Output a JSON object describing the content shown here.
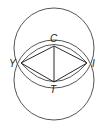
{
  "diagram": {
    "type": "geometric-construction",
    "stroke_color": "#555555",
    "line_color": "#2a2a2a",
    "background": "#ffffff",
    "points": [
      {
        "id": "C",
        "label": "C",
        "x": 54,
        "y": 46
      },
      {
        "id": "Y",
        "label": "Y",
        "x": 21,
        "y": 63
      },
      {
        "id": "I",
        "label": "I",
        "x": 87,
        "y": 63
      },
      {
        "id": "T",
        "label": "T",
        "x": 54,
        "y": 82
      }
    ],
    "circles": [
      {
        "name": "top-circle",
        "cx": 54,
        "cy": 48,
        "r": 40
      },
      {
        "name": "bottom-circle",
        "cx": 54,
        "cy": 80,
        "r": 40
      }
    ],
    "segments": [
      [
        "Y",
        "C"
      ],
      [
        "C",
        "I"
      ],
      [
        "I",
        "T"
      ],
      [
        "T",
        "Y"
      ],
      [
        "C",
        "T"
      ]
    ],
    "labels": {
      "C": "C",
      "Y": "Y",
      "I": "I",
      "T": "T"
    }
  }
}
